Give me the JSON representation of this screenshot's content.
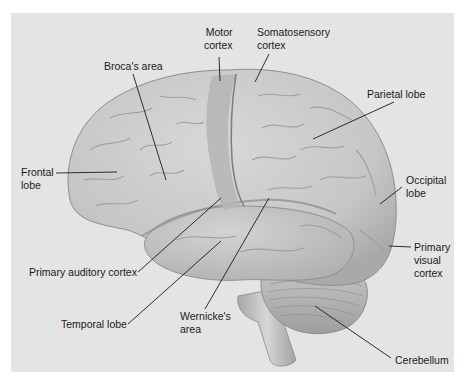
{
  "diagram": {
    "background_color": "#e4e4e4",
    "brain_color": "#c9c9c9",
    "labels": [
      {
        "id": "motor-cortex",
        "text": "Motor\ncortex",
        "x": 204,
        "y": 28,
        "align": "right"
      },
      {
        "id": "somatosensory-cortex",
        "text": "Somatosensory\ncortex",
        "x": 257,
        "y": 28,
        "align": "left"
      },
      {
        "id": "brocas-area",
        "text": "Broca's area",
        "x": 104,
        "y": 60,
        "align": "left"
      },
      {
        "id": "parietal-lobe",
        "text": "Parietal lobe",
        "x": 367,
        "y": 88,
        "align": "left"
      },
      {
        "id": "frontal-lobe",
        "text": "Frontal\nlobe",
        "x": 21,
        "y": 167,
        "align": "left"
      },
      {
        "id": "occipital-lobe",
        "text": "Occipital\nlobe",
        "x": 406,
        "y": 175,
        "align": "left"
      },
      {
        "id": "primary-visual-cortex",
        "text": "Primary\nvisual\ncortex",
        "x": 414,
        "y": 244,
        "align": "left"
      },
      {
        "id": "primary-auditory-cortex",
        "text": "Primary auditory cortex",
        "x": 29,
        "y": 266,
        "align": "left"
      },
      {
        "id": "temporal-lobe",
        "text": "Temporal lobe",
        "x": 61,
        "y": 318,
        "align": "left"
      },
      {
        "id": "wernickes-area",
        "text": "Wernicke's\narea",
        "x": 180,
        "y": 310,
        "align": "left"
      },
      {
        "id": "cerebellum",
        "text": "Cerebellum",
        "x": 395,
        "y": 355,
        "align": "left"
      }
    ],
    "leader_lines": [
      {
        "id": "motor-cortex",
        "x1": 219,
        "y1": 57,
        "x2": 220,
        "y2": 81
      },
      {
        "id": "somatosensory-cortex",
        "x1": 269,
        "y1": 54,
        "x2": 255,
        "y2": 82
      },
      {
        "id": "brocas-area",
        "x1": 133,
        "y1": 74,
        "x2": 166,
        "y2": 180
      },
      {
        "id": "parietal-lobe",
        "x1": 394,
        "y1": 102,
        "x2": 313,
        "y2": 139
      },
      {
        "id": "frontal-lobe",
        "x1": 56,
        "y1": 173,
        "x2": 117,
        "y2": 172
      },
      {
        "id": "occipital-lobe",
        "x1": 402,
        "y1": 187,
        "x2": 380,
        "y2": 204
      },
      {
        "id": "primary-visual-cortex",
        "x1": 411,
        "y1": 247,
        "x2": 389,
        "y2": 246
      },
      {
        "id": "primary-auditory-cortex",
        "x1": 138,
        "y1": 272,
        "x2": 221,
        "y2": 198
      },
      {
        "id": "temporal-lobe",
        "x1": 128,
        "y1": 324,
        "x2": 221,
        "y2": 241
      },
      {
        "id": "wernickes-area",
        "x1": 205,
        "y1": 309,
        "x2": 269,
        "y2": 198
      },
      {
        "id": "cerebellum",
        "x1": 391,
        "y1": 358,
        "x2": 315,
        "y2": 306
      }
    ]
  }
}
